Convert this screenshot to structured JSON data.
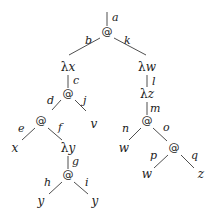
{
  "diagram": {
    "title": "",
    "nodes": [
      {
        "id": "n0",
        "text": "@",
        "x": 107,
        "y": 35,
        "kind": "app"
      },
      {
        "id": "n1",
        "text": "λx",
        "x": 68,
        "y": 71,
        "kind": "lam"
      },
      {
        "id": "n2",
        "text": "@",
        "x": 68,
        "y": 97,
        "kind": "app"
      },
      {
        "id": "n3",
        "text": "@",
        "x": 41,
        "y": 124,
        "kind": "app"
      },
      {
        "id": "n4",
        "text": "v",
        "x": 94,
        "y": 128,
        "kind": "var"
      },
      {
        "id": "n5",
        "text": "x",
        "x": 15,
        "y": 152,
        "kind": "var"
      },
      {
        "id": "n6",
        "text": "λy",
        "x": 68,
        "y": 152,
        "kind": "lam"
      },
      {
        "id": "n7",
        "text": "@",
        "x": 68,
        "y": 178,
        "kind": "app"
      },
      {
        "id": "n8",
        "text": "y",
        "x": 41,
        "y": 205,
        "kind": "var"
      },
      {
        "id": "n9",
        "text": "y",
        "x": 95,
        "y": 205,
        "kind": "var"
      },
      {
        "id": "n10",
        "text": "λw",
        "x": 147,
        "y": 71,
        "kind": "lam"
      },
      {
        "id": "n11",
        "text": "λz",
        "x": 147,
        "y": 98,
        "kind": "lam"
      },
      {
        "id": "n12",
        "text": "@",
        "x": 147,
        "y": 124,
        "kind": "app"
      },
      {
        "id": "n13",
        "text": "w",
        "x": 124,
        "y": 152,
        "kind": "var"
      },
      {
        "id": "n14",
        "text": "@",
        "x": 174,
        "y": 151,
        "kind": "app"
      },
      {
        "id": "n15",
        "text": "w",
        "x": 147,
        "y": 178,
        "kind": "var"
      },
      {
        "id": "n16",
        "text": "z",
        "x": 201,
        "y": 178,
        "kind": "var"
      }
    ],
    "edges": [
      {
        "label": "a",
        "x1": 107,
        "y1": 12,
        "x2": 107,
        "y2": 26,
        "lx": 112,
        "ly": 21
      },
      {
        "label": "b",
        "x1": 100,
        "y1": 38,
        "x2": 69,
        "y2": 55,
        "lx": 85,
        "ly": 44
      },
      {
        "label": "k",
        "x1": 114,
        "y1": 38,
        "x2": 146,
        "y2": 55,
        "lx": 124,
        "ly": 44
      },
      {
        "label": "c",
        "x1": 68,
        "y1": 75,
        "x2": 68,
        "y2": 88,
        "lx": 73,
        "ly": 84
      },
      {
        "label": "d",
        "x1": 61,
        "y1": 100,
        "x2": 52,
        "y2": 110,
        "lx": 47,
        "ly": 104
      },
      {
        "label": "j",
        "x1": 75,
        "y1": 100,
        "x2": 86,
        "y2": 111,
        "lx": 83,
        "ly": 104
      },
      {
        "label": "e",
        "x1": 35,
        "y1": 128,
        "x2": 22,
        "y2": 140,
        "lx": 18,
        "ly": 132
      },
      {
        "label": "f",
        "x1": 48,
        "y1": 128,
        "x2": 62,
        "y2": 140,
        "lx": 58,
        "ly": 131
      },
      {
        "label": "g",
        "x1": 68,
        "y1": 156,
        "x2": 68,
        "y2": 169,
        "lx": 72,
        "ly": 165
      },
      {
        "label": "h",
        "x1": 62,
        "y1": 182,
        "x2": 49,
        "y2": 194,
        "lx": 44,
        "ly": 186
      },
      {
        "label": "i",
        "x1": 74,
        "y1": 182,
        "x2": 88,
        "y2": 194,
        "lx": 85,
        "ly": 186
      },
      {
        "label": "l",
        "x1": 147,
        "y1": 75,
        "x2": 147,
        "y2": 87,
        "lx": 152,
        "ly": 85
      },
      {
        "label": "m",
        "x1": 147,
        "y1": 102,
        "x2": 147,
        "y2": 115,
        "lx": 150,
        "ly": 112
      },
      {
        "label": "n",
        "x1": 141,
        "y1": 128,
        "x2": 129,
        "y2": 140,
        "lx": 122,
        "ly": 132
      },
      {
        "label": "o",
        "x1": 153,
        "y1": 128,
        "x2": 167,
        "y2": 141,
        "lx": 163,
        "ly": 131
      },
      {
        "label": "p",
        "x1": 168,
        "y1": 155,
        "x2": 154,
        "y2": 168,
        "lx": 150,
        "ly": 159
      },
      {
        "label": "q",
        "x1": 181,
        "y1": 155,
        "x2": 194,
        "y2": 168,
        "lx": 191,
        "ly": 159
      }
    ]
  }
}
